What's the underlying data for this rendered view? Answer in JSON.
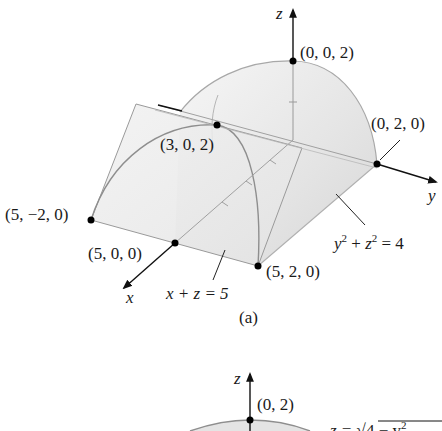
{
  "figure_a": {
    "caption": "(a)",
    "axes": {
      "x": "x",
      "y": "y",
      "z": "z"
    },
    "points": {
      "p002": "(0, 0, 2)",
      "p302": "(3, 0, 2)",
      "p020": "(0, 2, 0)",
      "p5m20": "(5, −2, 0)",
      "p500": "(5, 0, 0)",
      "p520": "(5, 2, 0)"
    },
    "labels": {
      "plane_lhs": "x + z = 5",
      "cylinder_y": "y",
      "cylinder_z": "z",
      "cylinder_exp": "2",
      "cylinder_rhs": " = 4",
      "cylinder_plus": " + "
    }
  },
  "figure_b": {
    "axes": {
      "z": "z"
    },
    "points": {
      "p02": "(0, 2)"
    },
    "labels": {
      "curve_lhs": "z = ",
      "curve_rad": "4 − y",
      "curve_exp": "2"
    }
  },
  "colors": {
    "surface_light": "#f2f2f2",
    "surface_mid": "#e2e2e2",
    "surface_dark": "#d4d4d4",
    "edge": "#9a9a9a",
    "axis": "#111111"
  }
}
